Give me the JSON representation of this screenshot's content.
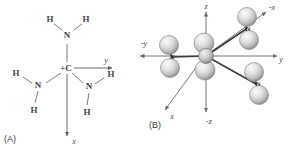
{
  "figure": {
    "panels": [
      {
        "id": "A",
        "label": "(A)",
        "type": "2d-lewis-structure",
        "center_atom": "+C",
        "center_charge": "+",
        "axes": [
          {
            "name": "y",
            "label": "y",
            "direction": "right"
          },
          {
            "name": "x",
            "label": "x",
            "direction": "down"
          }
        ],
        "groups": [
          {
            "id": "top",
            "atom": "N",
            "hydrogens": [
              {
                "label": "H",
                "position": "upper-left"
              },
              {
                "label": "H",
                "position": "upper-right"
              }
            ]
          },
          {
            "id": "lower-left",
            "atom": "N",
            "hydrogens": [
              {
                "label": "H",
                "position": "left"
              },
              {
                "label": "H",
                "position": "below"
              }
            ]
          },
          {
            "id": "lower-right",
            "atom": "N",
            "hydrogens": [
              {
                "label": "H",
                "position": "right"
              },
              {
                "label": "H",
                "position": "below"
              }
            ]
          }
        ]
      },
      {
        "id": "B",
        "label": "(B)",
        "type": "3d-ball-and-stick",
        "center_atom": "C",
        "axes": [
          {
            "name": "z",
            "label": "z",
            "direction": "up"
          },
          {
            "name": "-z",
            "label": "-z",
            "direction": "down"
          },
          {
            "name": "y",
            "label": "y",
            "direction": "right"
          },
          {
            "name": "-y",
            "label": "-y",
            "direction": "left"
          },
          {
            "name": "x",
            "label": "x",
            "direction": "lower-left"
          },
          {
            "name": "-x",
            "label": "-x",
            "direction": "upper-right"
          }
        ],
        "groups": [
          {
            "id": "left",
            "atom": "N",
            "hydrogen_count": 2
          },
          {
            "id": "upper-right",
            "atom": "N",
            "hydrogen_count": 2
          },
          {
            "id": "lower-right",
            "atom": "N",
            "hydrogen_count": 2
          }
        ]
      }
    ]
  },
  "labels": {
    "panel_a": "(A)",
    "panel_b": "(B)",
    "carbon_a": "+C",
    "nitrogen": "N",
    "hydrogen": "H",
    "axis_y": "y",
    "axis_x": "x",
    "axis_z": "z",
    "axis_neg_x": "-x",
    "axis_neg_y": "-y",
    "axis_neg_z": "-z"
  },
  "colors": {
    "background": "#ffffff",
    "bond": "#6e6e6e",
    "bond3d": "#3a3a3a",
    "text": "#3d3d3d",
    "axis": "#5a5a5a",
    "sphere_light": "#f2f2f2",
    "sphere_mid": "#c9c9c9",
    "sphere_dark": "#8d8d8d"
  }
}
